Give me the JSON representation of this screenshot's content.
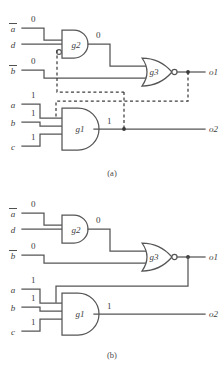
{
  "figure": {
    "type": "logic-circuit-diagram",
    "panels": [
      {
        "id": "a",
        "caption": "(a)",
        "style": "dashed-highlight",
        "inputs": [
          {
            "name": "a-bar",
            "label": "a",
            "overbar": true,
            "value": "0"
          },
          {
            "name": "d",
            "label": "d",
            "overbar": false,
            "value": ""
          },
          {
            "name": "b-bar",
            "label": "b",
            "overbar": true,
            "value": "0"
          },
          {
            "name": "a",
            "label": "a",
            "overbar": false,
            "value": "1"
          },
          {
            "name": "b",
            "label": "b",
            "overbar": false,
            "value": "1"
          },
          {
            "name": "c",
            "label": "c",
            "overbar": false,
            "value": "1"
          }
        ],
        "gates": [
          {
            "name": "g2",
            "label": "g2",
            "type": "and",
            "input_bubble": true,
            "output_bubble": false,
            "output_value": "0"
          },
          {
            "name": "g3",
            "label": "g3",
            "type": "or",
            "input_bubble": false,
            "output_bubble": true,
            "output_value": ""
          },
          {
            "name": "g1",
            "label": "g1",
            "type": "and",
            "input_bubble": false,
            "output_bubble": false,
            "output_value": "1"
          }
        ],
        "outputs": [
          {
            "name": "o1",
            "label": "o1"
          },
          {
            "name": "o2",
            "label": "o2"
          }
        ]
      },
      {
        "id": "b",
        "caption": "(b)",
        "style": "solid",
        "inputs": [
          {
            "name": "a-bar",
            "label": "a",
            "overbar": true,
            "value": "0"
          },
          {
            "name": "d",
            "label": "d",
            "overbar": false,
            "value": ""
          },
          {
            "name": "b-bar",
            "label": "b",
            "overbar": true,
            "value": "0"
          },
          {
            "name": "a",
            "label": "a",
            "overbar": false,
            "value": "1"
          },
          {
            "name": "b",
            "label": "b",
            "overbar": false,
            "value": "1"
          },
          {
            "name": "c",
            "label": "c",
            "overbar": false,
            "value": "1"
          }
        ],
        "gates": [
          {
            "name": "g2",
            "label": "g2",
            "type": "and",
            "input_bubble": false,
            "output_bubble": false,
            "output_value": "0"
          },
          {
            "name": "g3",
            "label": "g3",
            "type": "or",
            "input_bubble": false,
            "output_bubble": true,
            "output_value": ""
          },
          {
            "name": "g1",
            "label": "g1",
            "type": "and",
            "input_bubble": false,
            "output_bubble": false,
            "output_value": "1"
          }
        ],
        "outputs": [
          {
            "name": "o1",
            "label": "o1"
          },
          {
            "name": "o2",
            "label": "o2"
          }
        ]
      }
    ],
    "colors": {
      "wire": "#555555",
      "dashed_wire": "#3f3f3f",
      "text": "#3d3d3d",
      "background": "#ffffff"
    }
  }
}
